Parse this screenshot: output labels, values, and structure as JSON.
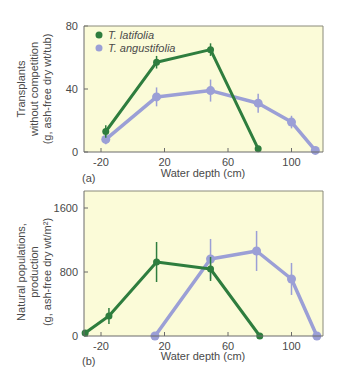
{
  "colors": {
    "latifolia": "#2e7d3e",
    "angustifolia": "#9b9fd6",
    "plot_background": "#fbfbd8",
    "axis": "#6b6b6b",
    "text": "#4a4a4a"
  },
  "legend": {
    "items": [
      {
        "label": "T. latifolia",
        "color": "#2e7d3e"
      },
      {
        "label": "T. angustifolia",
        "color": "#9b9fd6"
      }
    ]
  },
  "chart_data": [
    {
      "type": "line",
      "panel_label": "(a)",
      "xlabel": "Water depth (cm)",
      "ylabel_lines": [
        "Transplants",
        "without competition",
        "(g, ash-free dry wt/tub)"
      ],
      "xticks": [
        -20,
        20,
        60,
        100
      ],
      "yticks": [
        0,
        40,
        80
      ],
      "xlim": [
        -23,
        123
      ],
      "ylim": [
        0,
        80
      ],
      "legend_position": "upper left",
      "grid": false,
      "error_bars": true,
      "series": [
        {
          "name": "T. latifolia",
          "color": "#2e7d3e",
          "x": [
            -17,
            15,
            49,
            79
          ],
          "y": [
            13,
            57,
            65,
            2
          ],
          "err": [
            4,
            4,
            4,
            0
          ]
        },
        {
          "name": "T. angustifolia",
          "color": "#9b9fd6",
          "x": [
            -17,
            15,
            49,
            79,
            100,
            115
          ],
          "y": [
            8,
            35,
            39,
            31,
            19,
            1
          ],
          "err": [
            3,
            6,
            7,
            6,
            4,
            0
          ]
        }
      ]
    },
    {
      "type": "line",
      "panel_label": "(b)",
      "xlabel": "Water depth (cm)",
      "ylabel_lines": [
        "Natural populations,",
        "production",
        "(g, ash-free dry wt/m²)"
      ],
      "xticks": [
        -20,
        20,
        60,
        100
      ],
      "yticks": [
        0,
        800,
        1600
      ],
      "xlim": [
        -30,
        123
      ],
      "ylim": [
        0,
        1600
      ],
      "grid": false,
      "error_bars": true,
      "series": [
        {
          "name": "T. latifolia",
          "color": "#2e7d3e",
          "x": [
            -30,
            -15,
            15,
            49,
            80
          ],
          "y": [
            38,
            250,
            925,
            838,
            0
          ],
          "err": [
            0,
            100,
            250,
            150,
            0
          ]
        },
        {
          "name": "T. angustifolia",
          "color": "#9b9fd6",
          "x": [
            14,
            49,
            78,
            100,
            116
          ],
          "y": [
            0,
            963,
            1063,
            713,
            0
          ],
          "err": [
            0,
            250,
            250,
            200,
            0
          ]
        }
      ]
    }
  ]
}
